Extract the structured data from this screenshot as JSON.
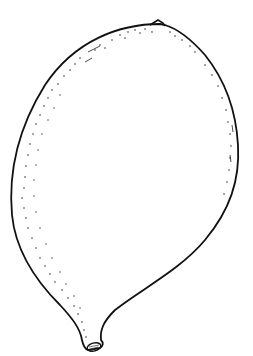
{
  "image": {
    "subject": "line drawing of a gourd-shaped fruit",
    "width": 253,
    "height": 356,
    "background": "#ffffff",
    "stroke_color": "#111111",
    "stipple_color": "#333333"
  }
}
